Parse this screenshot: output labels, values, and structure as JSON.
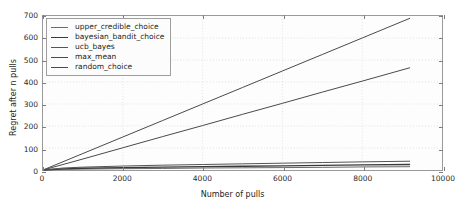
{
  "chart_data": {
    "type": "line",
    "title": "",
    "xlabel": "Number of pulls",
    "ylabel": "Regret after n pulls",
    "xlim": [
      0,
      10000
    ],
    "ylim": [
      0,
      700
    ],
    "xticks": [
      0,
      2000,
      4000,
      6000,
      8000,
      10000
    ],
    "yticks": [
      0,
      100,
      200,
      300,
      400,
      500,
      600,
      700
    ],
    "xticklabels": [
      "0",
      "2000",
      "4000",
      "6000",
      "8000",
      "10000"
    ],
    "yticklabels": [
      "0",
      "100",
      "200",
      "300",
      "400",
      "500",
      "600",
      "700"
    ],
    "grid": true,
    "grid_style": "dotted",
    "legend_position": "upper left",
    "x_end": 9200,
    "series": [
      {
        "name": "upper_credible_choice",
        "color": "#6b6b6b",
        "linewidth": 1.0,
        "x": [
          0,
          500,
          1000,
          2000,
          3000,
          4000,
          5000,
          6000,
          7000,
          8000,
          9200
        ],
        "values": [
          0,
          3,
          4,
          6,
          7,
          9,
          10,
          11,
          12,
          14,
          15
        ]
      },
      {
        "name": "bayesian_bandit_choice",
        "color": "#3a3a3a",
        "linewidth": 1.3,
        "x": [
          0,
          500,
          1000,
          2000,
          3000,
          4000,
          5000,
          6000,
          7000,
          8000,
          9200
        ],
        "values": [
          0,
          5,
          8,
          11,
          13,
          15,
          17,
          19,
          21,
          23,
          25
        ]
      },
      {
        "name": "ucb_bayes",
        "color": "#555555",
        "linewidth": 1.0,
        "x": [
          0,
          500,
          1000,
          2000,
          3000,
          4000,
          5000,
          6000,
          7000,
          8000,
          9200
        ],
        "values": [
          0,
          9,
          13,
          18,
          22,
          25,
          28,
          31,
          34,
          37,
          40
        ]
      },
      {
        "name": "max_mean",
        "color": "#4a4a4a",
        "linewidth": 1.0,
        "x": [
          0,
          1000,
          2000,
          3000,
          4000,
          5000,
          6000,
          7000,
          8000,
          9200
        ],
        "values": [
          0,
          50,
          101,
          152,
          202,
          253,
          303,
          354,
          404,
          465
        ]
      },
      {
        "name": "random_choice",
        "color": "#4a4a4a",
        "linewidth": 1.0,
        "x": [
          0,
          1000,
          2000,
          3000,
          4000,
          5000,
          6000,
          7000,
          8000,
          9200
        ],
        "values": [
          0,
          75,
          150,
          225,
          300,
          375,
          450,
          525,
          600,
          690
        ]
      }
    ]
  }
}
